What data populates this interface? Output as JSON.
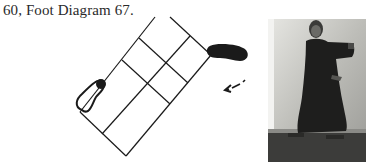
{
  "caption": {
    "text": "60, Foot Diagram 67."
  },
  "diagram": {
    "left_foot": "hollow",
    "right_foot": "solid",
    "arrow": "dashed arrow pointing down-left"
  },
  "photo": {
    "description": "Historical black-and-white photograph of a man in a long dark robe performing a martial arts posture"
  },
  "colors": {
    "ink": "#1a1a1a",
    "text": "#2a2a2a",
    "photo_bg": "#c8c8c4"
  }
}
